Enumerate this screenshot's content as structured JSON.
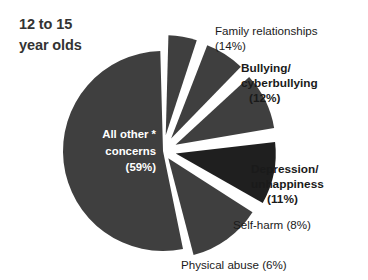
{
  "title": {
    "line1": "12 to 15",
    "line2": "year olds"
  },
  "colors": {
    "background": "#ffffff",
    "slice_default": "#3f3f3f",
    "slice_dark": "#1f1f1f",
    "slice_gap": "#ffffff",
    "title_text": "#333333",
    "label_text": "#1a1a1a",
    "interior_label_text": "#ffffff"
  },
  "interior_label": {
    "line1": "All other *",
    "line2": "concerns",
    "line3": "(59%)"
  },
  "callouts": {
    "family": {
      "line1": "Family relationships",
      "line2": "(14%)"
    },
    "bullying": {
      "line1": "Bullying/",
      "line2": "cyberbullying",
      "line3": "(12%)"
    },
    "depression": {
      "line1": "Depression/",
      "line2": "unhappiness",
      "line3": "(11%)"
    },
    "selfharm": {
      "line1": "Self-harm (8%)"
    },
    "physical": {
      "line1": "Physical abuse (6%)"
    }
  },
  "chart_data": {
    "type": "pie",
    "title": "12 to 15 year olds",
    "unit": "percent",
    "exploded": true,
    "legend": "none",
    "note": "* All other concerns",
    "categories": [
      "All other * concerns",
      "Family relationships",
      "Bullying/cyberbullying",
      "Depression/unhappiness",
      "Self-harm",
      "Physical abuse"
    ],
    "values": [
      59,
      14,
      12,
      11,
      8,
      6
    ],
    "labels": [
      "(59%)",
      "(14%)",
      "(12%)",
      "(11%)",
      "(8%)",
      "(6%)"
    ],
    "slice_colors": [
      "#3f3f3f",
      "#3f3f3f",
      "#1f1f1f",
      "#3f3f3f",
      "#3f3f3f",
      "#3f3f3f"
    ],
    "total": 110
  }
}
